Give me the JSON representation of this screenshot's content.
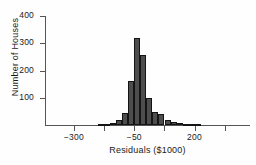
{
  "chart_data": {
    "type": "bar",
    "title": "",
    "subtitle": "",
    "xlabel": "Residuals ($1000)",
    "ylabel": "Number of Houses",
    "grid": false,
    "legend": false,
    "xlim": [
      -420,
      430
    ],
    "ylim": [
      0,
      400
    ],
    "x_tick_values": [
      -300,
      -175,
      -50,
      75,
      200,
      325
    ],
    "x_tick_labels": [
      "−300",
      "",
      "−50",
      "",
      "200",
      ""
    ],
    "y_tick_values": [
      100,
      200,
      300,
      400
    ],
    "y_tick_labels": [
      "100",
      "200",
      "300",
      "400"
    ],
    "bin_width": 25,
    "bin_centers": [
      -187,
      -162,
      -137,
      -112,
      -87,
      -62,
      -37,
      -12,
      13,
      38,
      63,
      88,
      113,
      138,
      163,
      188,
      213
    ],
    "values": [
      3,
      5,
      8,
      20,
      45,
      162,
      320,
      258,
      100,
      48,
      40,
      18,
      12,
      8,
      5,
      4,
      2
    ],
    "annotations": []
  },
  "figure": {
    "axis_color": "#555555",
    "bar_fill": "#4d4d4d",
    "bar_stroke": "#141414",
    "text_color": "#1a1a1a",
    "background": "#fefefe"
  }
}
